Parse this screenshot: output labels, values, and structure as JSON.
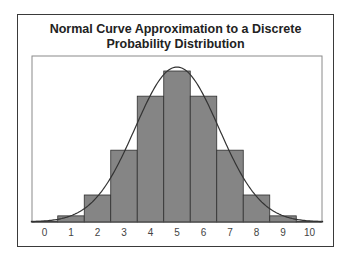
{
  "title_line1": "Normal Curve Approximation to a Discrete",
  "title_line2": "Probability Distribution",
  "colors": {
    "bar_fill": "#858585",
    "bar_stroke": "#2e2e2e",
    "curve": "#333333",
    "frame": "#3a3a3a",
    "plot_border": "#8a8a8a"
  },
  "chart_data": {
    "type": "bar",
    "title": "Normal Curve Approximation to a Discrete Probability Distribution",
    "xlabel": "",
    "ylabel": "",
    "categories": [
      "0",
      "1",
      "2",
      "3",
      "4",
      "5",
      "6",
      "7",
      "8",
      "9",
      "10"
    ],
    "values": [
      0.001,
      0.01,
      0.044,
      0.117,
      0.205,
      0.246,
      0.205,
      0.117,
      0.044,
      0.01,
      0.001
    ],
    "overlay": {
      "type": "line",
      "name": "Normal curve",
      "mean": 5,
      "sd": 1.58
    },
    "grid": false,
    "legend": "none",
    "y_axis_visible": false
  }
}
